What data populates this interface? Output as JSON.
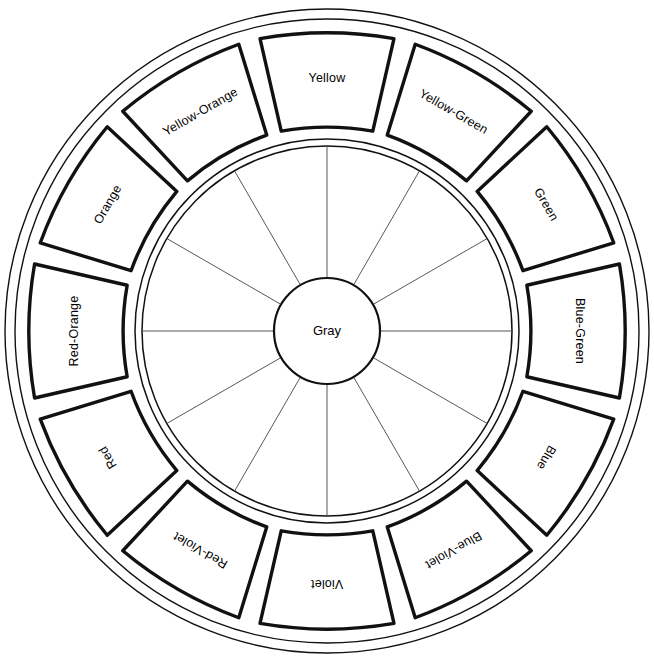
{
  "diagram": {
    "center": {
      "label": "Gray"
    },
    "geometry": {
      "cx": 327,
      "cy": 331,
      "outer_ring_radius_outer": 322,
      "outer_ring_radius_inner": 312,
      "swatch_outer_radius": 300,
      "swatch_inner_radius": 205,
      "inner_ring_radius_outer": 192,
      "inner_ring_radius_inner": 185,
      "center_circle_radius": 53,
      "segment_count": 12,
      "segment_angle_degrees": 30
    },
    "colors": {
      "stroke": "#111111",
      "thin_stroke": "#444444",
      "fill": "#ffffff",
      "background": "#ffffff"
    },
    "segments": [
      {
        "label": "Yellow",
        "angle": 0,
        "position": "top"
      },
      {
        "label": "Yellow-Green",
        "angle": 30,
        "position": "upper-right"
      },
      {
        "label": "Green",
        "angle": 60,
        "position": "right-upper"
      },
      {
        "label": "Blue-Green",
        "angle": 90,
        "position": "right"
      },
      {
        "label": "Blue",
        "angle": 120,
        "position": "right-lower"
      },
      {
        "label": "Blue-Violet",
        "angle": 150,
        "position": "lower-right"
      },
      {
        "label": "Violet",
        "angle": 180,
        "position": "bottom"
      },
      {
        "label": "Red-Violet",
        "angle": 210,
        "position": "lower-left"
      },
      {
        "label": "Red",
        "angle": 240,
        "position": "left-lower"
      },
      {
        "label": "Red-Orange",
        "angle": 270,
        "position": "left"
      },
      {
        "label": "Orange",
        "angle": 300,
        "position": "left-upper"
      },
      {
        "label": "Yellow-Orange",
        "angle": 330,
        "position": "upper-left"
      }
    ]
  }
}
